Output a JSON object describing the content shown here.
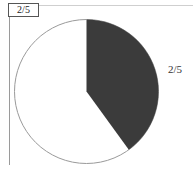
{
  "header": {
    "title": "2/5"
  },
  "slice_label": "2/5",
  "colors": {
    "filled": "#3b3b3b",
    "empty": "#ffffff",
    "outline": "#9a9a9a"
  },
  "chart_data": {
    "type": "pie",
    "title": "2/5",
    "categories": [
      "filled",
      "empty"
    ],
    "values": [
      2,
      3
    ],
    "labels": [
      "2/5",
      ""
    ],
    "start_angle": "12 o'clock, clockwise",
    "legend": "none"
  }
}
